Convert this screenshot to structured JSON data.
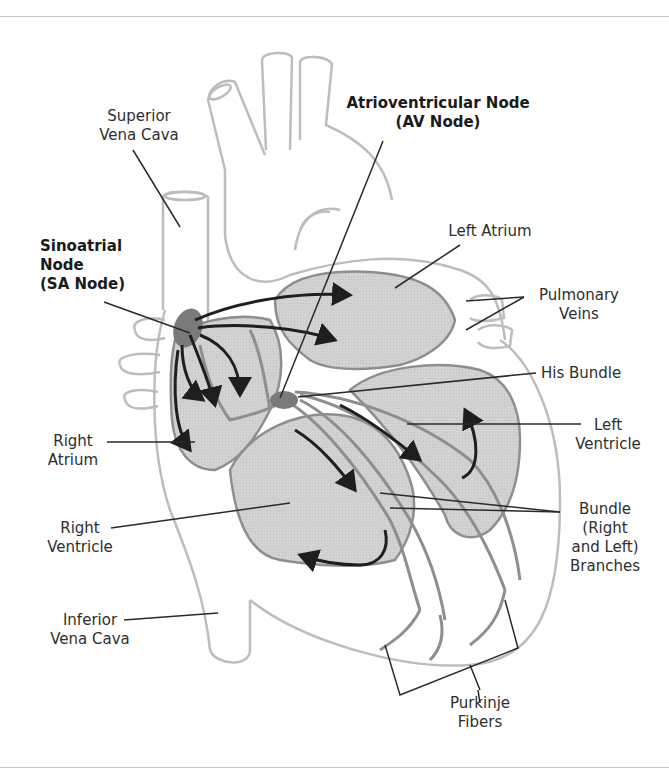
{
  "diagram": {
    "colors": {
      "outline": "#bdbdbd",
      "chamber_fill": "#cfcfcf",
      "conduction_path": "#8e8e8e",
      "node_fill": "#7a7a7a",
      "arrow": "#1e1e1e",
      "leader_line": "#2a2a2a",
      "rule": "#c8c8c8"
    },
    "labels": {
      "superior_vena_cava": [
        "Superior",
        "Vena Cava"
      ],
      "av_node": [
        "Atrioventricular Node",
        "(AV Node)"
      ],
      "left_atrium": [
        "Left Atrium"
      ],
      "sa_node": [
        "Sinoatrial",
        "Node",
        "(SA Node)"
      ],
      "pulmonary_veins": [
        "Pulmonary",
        "Veins"
      ],
      "his_bundle": [
        "His Bundle"
      ],
      "left_ventricle": [
        "Left",
        "Ventricle"
      ],
      "right_atrium": [
        "Right",
        "Atrium"
      ],
      "right_ventricle": [
        "Right",
        "Ventricle"
      ],
      "bundle_branches": [
        "Bundle",
        "(Right",
        "and Left)",
        "Branches"
      ],
      "inferior_vena_cava": [
        "Inferior",
        "Vena Cava"
      ],
      "purkinje_fibers": [
        "Purkinje",
        "Fibers"
      ]
    }
  }
}
